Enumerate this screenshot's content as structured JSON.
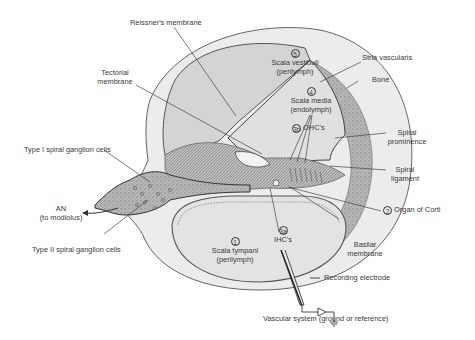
{
  "diagram": {
    "compartments": [
      {
        "number": "5",
        "name": "Scala vestibuli",
        "fluid": "(perilymph)"
      },
      {
        "number": "4",
        "name": "Scala media",
        "fluid": "(endolymph)"
      },
      {
        "number": "1",
        "name": "Scala tympani",
        "fluid": "(perilymph)"
      }
    ],
    "cells": {
      "ohc": {
        "number": "3b",
        "label": "OHC's"
      },
      "ihc": {
        "number": "3a",
        "label": "IHC's"
      }
    },
    "organ_of_corti": {
      "number": "2",
      "label": "Organ of Corti"
    },
    "labels": {
      "reissners_membrane": "Reissner's membrane",
      "tectorial_membrane_1": "Tectorial",
      "tectorial_membrane_2": "membrane",
      "stria_vascularis": "Stria vascularis",
      "bone": "Bone",
      "spiral_prominence_1": "Spiral",
      "spiral_prominence_2": "prominence",
      "spiral_ligament_1": "Spiral",
      "spiral_ligament_2": "ligament",
      "type1_ganglion": "Type I spiral ganglion cells",
      "type2_ganglion": "Type II spiral ganglion cells",
      "an_1": "AN",
      "an_2": "(to modiolus)",
      "basilar_membrane_1": "Basilar",
      "basilar_membrane_2": "membrane",
      "recording_electrode": "Recording electrode",
      "vascular_system": "Vascular system (ground or reference)"
    },
    "colors": {
      "background": "#ffffff",
      "scala_fill": "#d4d4d4",
      "scala_tympani_fill": "#e3e3e3",
      "bone_ring": "#ececec",
      "outline": "#555555",
      "tissue": "#a8a8a8",
      "label_text": "#3a3a3a"
    }
  }
}
